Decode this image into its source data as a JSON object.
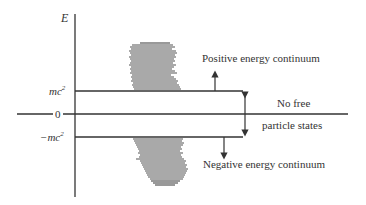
{
  "diagram": {
    "axis_label": "E",
    "levels": {
      "positive": {
        "label": "mc",
        "superscript": "2"
      },
      "zero": {
        "label": "0"
      },
      "negative": {
        "label": "−mc",
        "superscript": "2"
      }
    },
    "annotations": {
      "positive_continuum": "Positive energy continuum",
      "negative_continuum": "Negative energy continuum",
      "gap_line1": "No free",
      "gap_line2": "particle states"
    },
    "colors": {
      "line": "#333333",
      "hatch": "#555555",
      "background": "#ffffff"
    }
  }
}
